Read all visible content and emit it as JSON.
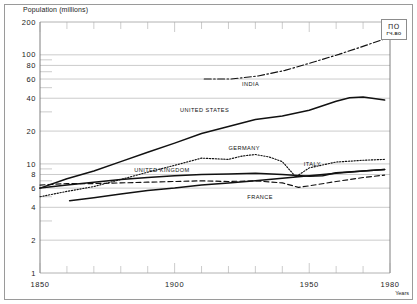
{
  "figure": {
    "y_axis_title": "Population (millions)",
    "x_axis_title": "Years",
    "stamp_line1": "ПО",
    "stamp_line2": "ГЧ-ВО",
    "axis_color": "#6f6f6f",
    "grid_color": "#a9a9a9",
    "line_color": "#111111"
  },
  "chart_data": {
    "type": "line",
    "title": "Population (millions)",
    "xlabel": "Years",
    "ylabel": "Population (millions)",
    "yscale": "log",
    "xlim": [
      1850,
      1980
    ],
    "ylim": [
      1,
      200
    ],
    "grid": true,
    "legend": "inline-labels",
    "y_ticks": [
      200,
      100,
      80,
      60,
      40,
      20,
      10,
      8,
      6,
      4,
      2,
      1
    ],
    "y_tick_labels": [
      "200",
      "100",
      "80",
      "60",
      "40",
      "20",
      "10",
      "8",
      "6",
      "4",
      "2",
      "1"
    ],
    "y_minor_ticks": [
      90,
      70,
      50,
      30,
      9,
      7,
      5,
      3
    ],
    "x_ticks": [
      1850,
      1900,
      1950,
      1980
    ],
    "x_tick_labels": [
      "1850",
      "1900",
      "1950",
      "1980"
    ],
    "x_minor_ticks": [
      1860,
      1870,
      1880,
      1890,
      1910,
      1920,
      1930,
      1940,
      1960,
      1970
    ],
    "series": [
      {
        "name": "INDIA",
        "style": "dashdot",
        "label_x": 1925,
        "label_y": 52,
        "x": [
          1911,
          1921,
          1931,
          1941,
          1951,
          1961,
          1971,
          1978
        ],
        "values": [
          60,
          60,
          64,
          72,
          85,
          101,
          122,
          140
        ]
      },
      {
        "name": "UNITED STATES",
        "style": "solid",
        "label_x": 1902,
        "label_y": 30,
        "x": [
          1850,
          1860,
          1870,
          1880,
          1890,
          1900,
          1910,
          1920,
          1930,
          1940,
          1950,
          1960,
          1965,
          1970,
          1978
        ],
        "values": [
          6.0,
          7.3,
          8.6,
          10.5,
          12.8,
          15.5,
          19.0,
          22.0,
          25.5,
          27.5,
          31.0,
          37.5,
          40.5,
          41.0,
          38.5
        ]
      },
      {
        "name": "GERMANY",
        "style": "dotted",
        "label_x": 1920,
        "label_y": 13.5,
        "x": [
          1850,
          1860,
          1870,
          1880,
          1890,
          1900,
          1910,
          1920,
          1925,
          1930,
          1935,
          1940,
          1945,
          1950,
          1960,
          1970,
          1978
        ],
        "values": [
          5.0,
          5.6,
          6.2,
          7.2,
          8.4,
          9.7,
          11.3,
          11.0,
          11.8,
          12.2,
          11.6,
          10.5,
          7.6,
          9.2,
          10.4,
          10.8,
          11.0
        ]
      },
      {
        "name": "UNITED KINGDOM",
        "style": "solid",
        "label_x": 1885,
        "label_y": 8.4,
        "x": [
          1850,
          1860,
          1870,
          1880,
          1890,
          1900,
          1910,
          1920,
          1930,
          1940,
          1950,
          1955,
          1960,
          1970,
          1978
        ],
        "values": [
          6.0,
          6.4,
          6.8,
          7.2,
          7.5,
          7.8,
          8.0,
          8.1,
          8.2,
          8.0,
          7.7,
          7.8,
          8.3,
          8.6,
          8.9
        ]
      },
      {
        "name": "ITALY",
        "style": "solid",
        "label_x": 1948,
        "label_y": 9.5,
        "x": [
          1861,
          1870,
          1880,
          1890,
          1900,
          1910,
          1920,
          1930,
          1940,
          1950,
          1960,
          1970,
          1978
        ],
        "values": [
          4.6,
          4.9,
          5.3,
          5.7,
          6.0,
          6.4,
          6.7,
          7.0,
          7.4,
          7.8,
          8.2,
          8.6,
          8.9
        ]
      },
      {
        "name": "FRANCE",
        "style": "dashed",
        "label_x": 1927,
        "label_y": 4.8,
        "x": [
          1850,
          1860,
          1870,
          1880,
          1890,
          1900,
          1910,
          1920,
          1930,
          1940,
          1946,
          1950,
          1960,
          1970,
          1978
        ],
        "values": [
          6.4,
          6.6,
          6.6,
          6.7,
          6.8,
          6.9,
          7.0,
          6.9,
          7.0,
          6.7,
          6.1,
          6.3,
          6.9,
          7.5,
          7.9
        ]
      }
    ]
  }
}
